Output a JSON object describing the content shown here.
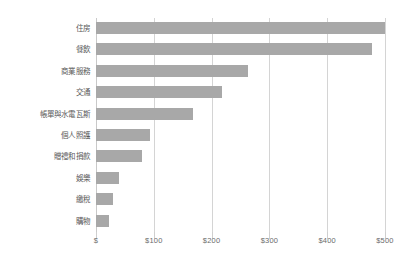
{
  "chart_data": {
    "type": "bar",
    "orientation": "horizontal",
    "title": "",
    "subtitle": "",
    "xlabel": "",
    "ylabel": "",
    "categories": [
      "住房",
      "餐飲",
      "商業服務",
      "交通",
      "帳單與水電瓦斯",
      "個人照護",
      "贈禮和捐款",
      "娛樂",
      "繳稅",
      "購物"
    ],
    "values": [
      500,
      477,
      263,
      218,
      168,
      94,
      80,
      40,
      30,
      23
    ],
    "series": [
      {
        "name": "支出",
        "values": [
          500,
          477,
          263,
          218,
          168,
          94,
          80,
          40,
          30,
          23
        ]
      }
    ],
    "xlim": [
      0,
      500
    ],
    "x_ticks": [
      0,
      100,
      200,
      300,
      400,
      500
    ],
    "x_tick_labels": [
      "$",
      "$100",
      "$200",
      "$300",
      "$400",
      "$500"
    ],
    "grid": "vertical",
    "legend": "none",
    "bar_color": "#a8a8a8",
    "gridline_color": "#d4d4d4",
    "label_color": "#595959",
    "tick_label_color": "#6b6b6b",
    "background_color": "#ffffff"
  }
}
